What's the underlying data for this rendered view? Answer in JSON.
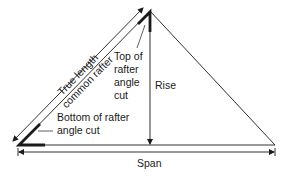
{
  "diagram": {
    "type": "roof-rafter-geometry",
    "labels": {
      "rafter_line1": "True length",
      "rafter_line2": "common rafter",
      "top_cut_line1": "Top of",
      "top_cut_line2": "rafter",
      "top_cut_line3": "angle",
      "top_cut_line4": "cut",
      "rise": "Rise",
      "bottom_cut_line1": "Bottom of rafter",
      "bottom_cut_line2": "angle cut",
      "span": "Span"
    },
    "colors": {
      "line": "#1a1a1a",
      "background": "#ffffff"
    }
  }
}
